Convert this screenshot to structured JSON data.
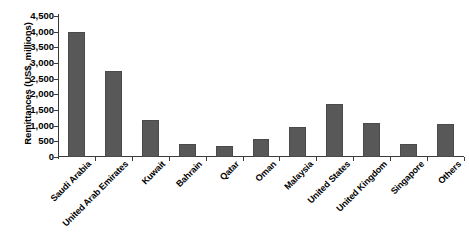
{
  "chart_data": {
    "type": "bar",
    "title": "",
    "xlabel": "",
    "ylabel": "Remittances (US$, millions)",
    "ylim": [
      0,
      4500
    ],
    "ytick_step": 500,
    "grid": false,
    "legend": null,
    "orientation": "vertical",
    "bar_color": "#585858",
    "axis_color": "#3b3b3b",
    "background": "#ffffff",
    "ytick_labels": [
      "4,500",
      "4,000",
      "3,500",
      "3,000",
      "2,500",
      "2,000",
      "1,500",
      "1,000",
      "500",
      "0"
    ],
    "ytick_values": [
      4500,
      4000,
      3500,
      3000,
      2500,
      2000,
      1500,
      1000,
      500,
      0
    ],
    "categories": [
      "Saudi Arabia",
      "United Arab Emirates",
      "Kuwait",
      "Bahrain",
      "Qatar",
      "Oman",
      "Malaysia",
      "United States",
      "United Kingdom",
      "Singapore",
      "Others"
    ],
    "values": [
      3980,
      2750,
      1180,
      400,
      350,
      570,
      960,
      1700,
      1080,
      430,
      1050
    ]
  }
}
